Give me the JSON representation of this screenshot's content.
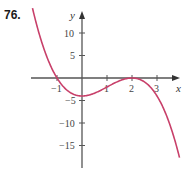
{
  "problem": {
    "number": "76."
  },
  "chart_data": {
    "type": "line",
    "title": "",
    "xlabel": "x",
    "ylabel": "y",
    "function": "y = -(x+1)(x-2)^2",
    "x_ticks": [
      -1,
      1,
      2,
      3
    ],
    "x_tick_labels": [
      "−1",
      "1",
      "2",
      "3"
    ],
    "y_ticks": [
      10,
      5,
      -5,
      -10,
      -15
    ],
    "y_tick_labels": [
      "10",
      "5",
      "−5",
      "−10",
      "−15"
    ],
    "xlim": [
      -2,
      4
    ],
    "ylim": [
      -20,
      16
    ],
    "grid": false,
    "series": [
      {
        "name": "curve",
        "color": "#c8406a",
        "x": [
          -2,
          -1.5,
          -1,
          -0.5,
          0,
          0.5,
          1,
          1.5,
          2,
          2.5,
          3,
          3.5,
          3.9
        ],
        "values": [
          16,
          6.125,
          0,
          -3.125,
          -4,
          -3.375,
          -2,
          -0.625,
          0,
          -0.875,
          -4,
          -10.125,
          -17.7
        ]
      }
    ],
    "key_points": {
      "x_intercepts": [
        -1,
        2
      ],
      "y_intercept": -4
    }
  },
  "colors": {
    "curve": "#c8406a",
    "axis": "#555555"
  }
}
